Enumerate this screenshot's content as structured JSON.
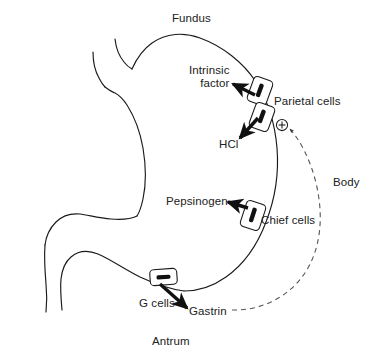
{
  "diagram": {
    "colors": {
      "outline": "#1a1a1a",
      "text": "#212121",
      "arrow": "#111111",
      "cell_fill": "#ffffff",
      "nucleus": "#111111",
      "feedback_dash": "#555555"
    },
    "anatomy_labels": [
      {
        "id": "fundus",
        "text": "Fundus"
      },
      {
        "id": "body",
        "text": "Body"
      },
      {
        "id": "antrum",
        "text": "Antrum"
      }
    ],
    "secretion_labels": [
      {
        "id": "intrinsic-factor",
        "text": "Intrinsic\nfactor",
        "line1": "Intrinsic",
        "line2": "factor"
      },
      {
        "id": "hcl",
        "text": "HCl"
      },
      {
        "id": "pepsinogen",
        "text": "Pepsinogen"
      },
      {
        "id": "gastrin",
        "text": "Gastrin"
      }
    ],
    "cell_labels": [
      {
        "id": "parietal-cells",
        "text": "Parietal cells",
        "nucleus_orientation": "vertical",
        "count": 2
      },
      {
        "id": "chief-cells",
        "text": "Chief cells",
        "nucleus_orientation": "vertical",
        "count": 1
      },
      {
        "id": "g-cells",
        "text": "G cells",
        "nucleus_orientation": "horizontal",
        "count": 1
      }
    ],
    "feedback": {
      "id": "gastrin-stimulation",
      "symbol": "+",
      "style": "dashed",
      "from": "Gastrin",
      "to": "Parietal cells"
    }
  }
}
